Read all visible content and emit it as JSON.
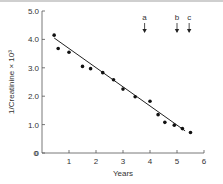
{
  "chart_data": {
    "type": "scatter",
    "title": "",
    "xlabel": "Years",
    "ylabel": "1/Creatinine × 10³",
    "xlim": [
      0,
      6
    ],
    "ylim": [
      0,
      5.0
    ],
    "x_ticks": [
      "0",
      "1",
      "2",
      "3",
      "4",
      "5",
      "6"
    ],
    "y_ticks": [
      "0",
      "1.0",
      "2.0",
      "3.0",
      "4.0",
      "5.0"
    ],
    "grid": false,
    "legend": null,
    "series": [
      {
        "name": "measurements",
        "type": "scatter",
        "points": [
          {
            "x": 0.45,
            "y": 4.15
          },
          {
            "x": 0.6,
            "y": 3.68
          },
          {
            "x": 1.0,
            "y": 3.55
          },
          {
            "x": 1.5,
            "y": 3.05
          },
          {
            "x": 1.8,
            "y": 2.97
          },
          {
            "x": 2.25,
            "y": 2.83
          },
          {
            "x": 2.65,
            "y": 2.58
          },
          {
            "x": 3.0,
            "y": 2.25
          },
          {
            "x": 3.45,
            "y": 1.98
          },
          {
            "x": 4.0,
            "y": 1.82
          },
          {
            "x": 4.3,
            "y": 1.35
          },
          {
            "x": 4.55,
            "y": 1.08
          },
          {
            "x": 4.9,
            "y": 0.98
          },
          {
            "x": 5.2,
            "y": 0.86
          },
          {
            "x": 5.5,
            "y": 0.72
          }
        ]
      },
      {
        "name": "regression line",
        "type": "line",
        "points": [
          {
            "x": 0.45,
            "y": 4.05
          },
          {
            "x": 5.3,
            "y": 0.78
          }
        ]
      }
    ],
    "annotations": [
      {
        "label": "a",
        "x": 3.8,
        "type": "down-arrow"
      },
      {
        "label": "b",
        "x": 5.0,
        "type": "down-arrow"
      },
      {
        "label": "c",
        "x": 5.45,
        "type": "down-arrow"
      }
    ]
  }
}
